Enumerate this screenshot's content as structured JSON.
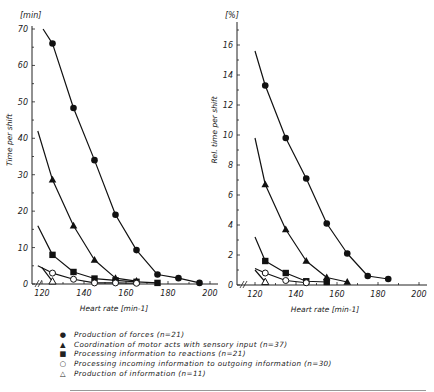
{
  "chart_data": [
    {
      "type": "line",
      "title": "",
      "unit_label": "[min]",
      "xlabel": "Heart rate [min-1]",
      "ylabel": "Time per shift",
      "xlim": [
        120,
        200
      ],
      "ylim": [
        0,
        70
      ],
      "xticks": [
        120,
        140,
        160,
        180,
        200
      ],
      "yticks": [
        0,
        10,
        20,
        30,
        40,
        50,
        60,
        70
      ],
      "grid": false,
      "series": [
        {
          "name": "Production of forces (n=21)",
          "marker": "filled-circle",
          "x": [
            125,
            135,
            145,
            155,
            165,
            175,
            185,
            195
          ],
          "y": [
            66,
            48.3,
            34,
            19,
            9.3,
            2.6,
            1.6,
            0.3
          ],
          "line_start": [
            120.5,
            70
          ]
        },
        {
          "name": "Coordination of motor acts with sensory input (n=37)",
          "marker": "filled-triangle",
          "x": [
            125,
            135,
            145,
            155,
            165
          ],
          "y": [
            28.6,
            16,
            6.6,
            1.6,
            0.8
          ],
          "line_start": [
            118,
            42
          ]
        },
        {
          "name": "Processing information to reactions (n=21)",
          "marker": "filled-square",
          "x": [
            125,
            135,
            145,
            155,
            165,
            175
          ],
          "y": [
            8,
            3.3,
            1.5,
            1,
            0.6,
            0.3
          ],
          "line_start": [
            118,
            16
          ]
        },
        {
          "name": "Processing incoming information to outgoing information (n=30)",
          "marker": "open-circle",
          "x": [
            125,
            135,
            145,
            155,
            165
          ],
          "y": [
            3,
            1.3,
            0.3,
            0.3,
            0.2
          ],
          "line_start": [
            118,
            5
          ]
        },
        {
          "name": "Production of information (n=11)",
          "marker": "open-triangle",
          "x": [
            125
          ],
          "y": [
            0.7
          ],
          "line_start": [
            120,
            4.5
          ]
        }
      ]
    },
    {
      "type": "line",
      "title": "",
      "unit_label": "[%]",
      "xlabel": "Heart rate [min-1]",
      "ylabel": "Rel. time per shift",
      "xlim": [
        120,
        200
      ],
      "ylim": [
        0,
        17
      ],
      "xticks": [
        120,
        140,
        160,
        180,
        200
      ],
      "yticks": [
        0,
        2,
        4,
        6,
        8,
        10,
        12,
        14,
        16
      ],
      "grid": false,
      "series": [
        {
          "name": "Production of forces (n=21)",
          "marker": "filled-circle",
          "x": [
            125,
            135,
            145,
            155,
            165,
            175,
            185
          ],
          "y": [
            13.3,
            9.8,
            7.1,
            4.1,
            2.1,
            0.6,
            0.4
          ],
          "line_start": [
            120,
            15.6
          ]
        },
        {
          "name": "Coordination of motor acts with sensory input (n=37)",
          "marker": "filled-triangle",
          "x": [
            125,
            135,
            145,
            155,
            165
          ],
          "y": [
            6.7,
            3.7,
            1.6,
            0.5,
            0.2
          ],
          "line_start": [
            120,
            9.8
          ]
        },
        {
          "name": "Processing information to reactions (n=21)",
          "marker": "filled-square",
          "x": [
            125,
            135,
            145,
            155
          ],
          "y": [
            1.6,
            0.8,
            0.25,
            0.2
          ],
          "line_start": [
            120,
            3.2
          ]
        },
        {
          "name": "Processing incoming information to outgoing information (n=30)",
          "marker": "open-circle",
          "x": [
            125,
            135,
            145
          ],
          "y": [
            0.8,
            0.3,
            0.15
          ],
          "line_start": [
            120,
            1.1
          ]
        },
        {
          "name": "Production of information (n=11)",
          "marker": "open-triangle",
          "x": [
            125
          ],
          "y": [
            0.2
          ],
          "line_start": [
            120,
            1.0
          ]
        }
      ]
    }
  ],
  "legend": {
    "items": [
      {
        "symbol": "●",
        "label": "Production of forces (n=21)"
      },
      {
        "symbol": "▲",
        "label": "Coordination of motor acts with sensory input (n=37)"
      },
      {
        "symbol": "■",
        "label": "Processing information to reactions (n=21)"
      },
      {
        "symbol": "○",
        "label": "Processing incoming information to outgoing information (n=30)"
      },
      {
        "symbol": "△",
        "label": "Production of information (n=11)"
      }
    ]
  },
  "axes_text": {
    "left_unit": "[min]",
    "left_ylabel": "Time per shift",
    "right_unit": "[%]",
    "right_ylabel": "Rel. time per shift",
    "xlabel": "Heart rate [min-1]"
  }
}
